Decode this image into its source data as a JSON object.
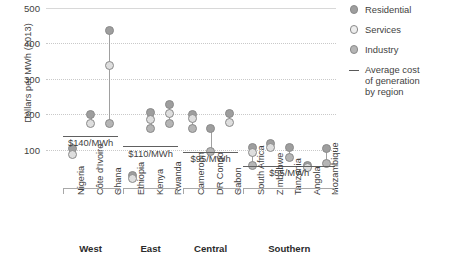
{
  "chart_data": {
    "type": "scatter",
    "title": "",
    "xlabel": "",
    "ylabel": "Dollars per MWh (2013)",
    "ylim": [
      0,
      500
    ],
    "yticks": [
      100,
      200,
      300,
      400,
      500
    ],
    "grid": true,
    "legend_position": "right",
    "legend": [
      {
        "key": "residential",
        "label": "Residential",
        "marker": "circle",
        "color": "#9e9e9e"
      },
      {
        "key": "services",
        "label": "Services",
        "marker": "circle",
        "color": "#ededed"
      },
      {
        "key": "industry",
        "label": "Industry",
        "marker": "circle",
        "color": "#b5b5b5"
      },
      {
        "key": "average",
        "label": "Average cost of generation by region",
        "marker": "line",
        "color": "#595959"
      }
    ],
    "regions": [
      {
        "name": "West",
        "average_label": "$140/MWh",
        "average_value": 140,
        "countries": [
          {
            "name": "Nigeria",
            "residential": 105,
            "services": 88,
            "industry": null
          },
          {
            "name": "Côte d'Ivoire",
            "residential": 200,
            "services": 175,
            "industry": null
          },
          {
            "name": "Ghana",
            "residential": 437,
            "services": 337,
            "industry": 175
          }
        ]
      },
      {
        "name": "East",
        "average_label": "$110/MWh",
        "average_value": 110,
        "countries": [
          {
            "name": "Ethiopia",
            "residential": 28,
            "services": 20,
            "industry": null
          },
          {
            "name": "Kenya",
            "residential": 205,
            "services": 185,
            "industry": 160
          },
          {
            "name": "Rwanda",
            "residential": 228,
            "services": 202,
            "industry": 175
          }
        ]
      },
      {
        "name": "Central",
        "average_label": "$95/MWh",
        "average_value": 95,
        "countries": [
          {
            "name": "Cameroon",
            "residential": 200,
            "services": 188,
            "industry": 160
          },
          {
            "name": "DR Congo",
            "residential": 160,
            "services": null,
            "industry": 95
          },
          {
            "name": "Gabon",
            "residential": 202,
            "services": 178,
            "industry": null
          }
        ]
      },
      {
        "name": "Southern",
        "average_label": "$55/MWh",
        "average_value": 55,
        "countries": [
          {
            "name": "South Africa",
            "residential": 108,
            "services": 92,
            "industry": 55
          },
          {
            "name": "Zimbabwe",
            "residential": 118,
            "services": 108,
            "industry": null
          },
          {
            "name": "Tanzania",
            "residential": 108,
            "services": null,
            "industry": 80
          },
          {
            "name": "Angola",
            "residential": 55,
            "services": 50,
            "industry": null
          },
          {
            "name": "Mozambique",
            "residential": 105,
            "services": null,
            "industry": 62
          }
        ]
      }
    ]
  },
  "axis": {
    "y_label": "Dollars per MWh (2013)",
    "y_ticks": [
      "500",
      "400",
      "300",
      "200",
      "100"
    ]
  },
  "legend": {
    "residential": "Residential",
    "services": "Services",
    "industry": "Industry",
    "average_line1": "Average cost",
    "average_line2": "of generation",
    "average_line3": "by region"
  }
}
